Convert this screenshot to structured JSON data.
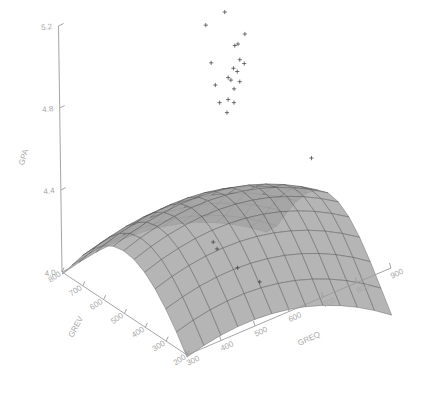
{
  "chart_data": {
    "type": "scatter",
    "title": "",
    "subtitle": "",
    "projection": "3d-surface-with-scatter",
    "grid": false,
    "legend": null,
    "zlabel": "GPA",
    "xlabel": "GREQ",
    "ylabel": "GREV",
    "zlim": [
      4.0,
      5.2
    ],
    "xlim": [
      300,
      900
    ],
    "ylim": [
      200,
      800
    ],
    "z_ticks": [
      "4.0",
      "4.4",
      "4.8",
      "5.2"
    ],
    "z_tick_values": [
      4.0,
      4.4,
      4.8,
      5.2
    ],
    "x_ticks": [
      "300",
      "400",
      "500",
      "600",
      "700",
      "800",
      "900"
    ],
    "x_tick_values": [
      300,
      400,
      500,
      600,
      700,
      800,
      900
    ],
    "y_ticks": [
      "200",
      "300",
      "400",
      "500",
      "600",
      "700",
      "800"
    ],
    "y_tick_values": [
      200,
      300,
      400,
      500,
      600,
      700,
      800
    ],
    "surface_color": "#a3a3a3",
    "mesh_color": "#4a4a4a",
    "axis_color": "#a8a8a8",
    "point_color": "#3a3a3a",
    "point_marker": "plus",
    "points": [
      {
        "greq": 610,
        "grev": 600,
        "gpa": 5.12
      },
      {
        "greq": 690,
        "grev": 640,
        "gpa": 5.1
      },
      {
        "greq": 655,
        "grev": 520,
        "gpa": 5.05
      },
      {
        "greq": 600,
        "grev": 560,
        "gpa": 4.97
      },
      {
        "greq": 700,
        "grev": 610,
        "gpa": 4.95
      },
      {
        "greq": 575,
        "grev": 500,
        "gpa": 4.92
      },
      {
        "greq": 760,
        "grev": 660,
        "gpa": 4.93
      },
      {
        "greq": 640,
        "grev": 545,
        "gpa": 4.88
      },
      {
        "greq": 680,
        "grev": 585,
        "gpa": 4.87
      },
      {
        "greq": 720,
        "grev": 620,
        "gpa": 4.86
      },
      {
        "greq": 660,
        "grev": 565,
        "gpa": 4.84
      },
      {
        "greq": 590,
        "grev": 505,
        "gpa": 4.82
      },
      {
        "greq": 700,
        "grev": 600,
        "gpa": 4.83
      },
      {
        "greq": 745,
        "grev": 640,
        "gpa": 4.81
      },
      {
        "greq": 630,
        "grev": 530,
        "gpa": 4.79
      },
      {
        "greq": 675,
        "grev": 575,
        "gpa": 4.78
      },
      {
        "greq": 710,
        "grev": 605,
        "gpa": 4.77
      },
      {
        "greq": 620,
        "grev": 520,
        "gpa": 4.74
      },
      {
        "greq": 665,
        "grev": 560,
        "gpa": 4.73
      },
      {
        "greq": 835,
        "grev": 470,
        "gpa": 4.4
      },
      {
        "greq": 520,
        "grev": 430,
        "gpa": 4.24
      },
      {
        "greq": 525,
        "grev": 420,
        "gpa": 4.21
      },
      {
        "greq": 560,
        "grev": 380,
        "gpa": 4.12
      },
      {
        "greq": 600,
        "grev": 340,
        "gpa": 4.05
      }
    ]
  }
}
